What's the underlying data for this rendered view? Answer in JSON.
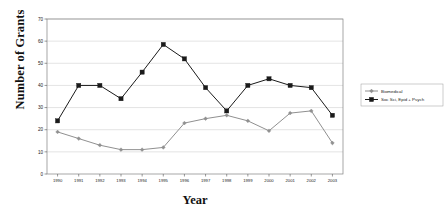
{
  "chart_data": {
    "type": "line",
    "title": "",
    "xlabel": "Year",
    "ylabel": "Number of Grants",
    "categories": [
      "1990",
      "1991",
      "1992",
      "1993",
      "1994",
      "1995",
      "1996",
      "1997",
      "1998",
      "1999",
      "2000",
      "2001",
      "2002",
      "2003"
    ],
    "x": [
      1990,
      1991,
      1992,
      1993,
      1994,
      1995,
      1996,
      1997,
      1998,
      1999,
      2000,
      2001,
      2002,
      2003
    ],
    "series": [
      {
        "name": "Biomedical",
        "color": "#909090",
        "marker": "diamond",
        "values": [
          19,
          16,
          13,
          11,
          11,
          12,
          23,
          25,
          26.5,
          24,
          19.5,
          27.5,
          28.5,
          14
        ]
      },
      {
        "name": "Soc Sci, Epid + Psych",
        "color": "#1a1a1a",
        "marker": "square",
        "values": [
          24,
          40,
          40,
          34,
          46,
          58.5,
          52,
          39,
          28.5,
          40,
          43,
          40,
          39,
          26.5
        ]
      }
    ],
    "ylim": [
      0,
      70
    ],
    "yticks": [
      0,
      10,
      20,
      30,
      40,
      50,
      60,
      70
    ],
    "ytick_labels": [
      "0",
      "10",
      "20",
      "30",
      "40",
      "50",
      "60",
      "70"
    ],
    "grid": true,
    "grid_axis": "y",
    "grid_color": "#c8c8c8",
    "legend_position": "right",
    "plot_border_color": "#808080",
    "background": "#ffffff"
  },
  "axes": {
    "y_title": "Number of Grants",
    "x_title": "Year"
  },
  "legend": {
    "entries": [
      {
        "label": "Biomedical"
      },
      {
        "label": "Soc Sci, Epid + Psych"
      }
    ]
  }
}
